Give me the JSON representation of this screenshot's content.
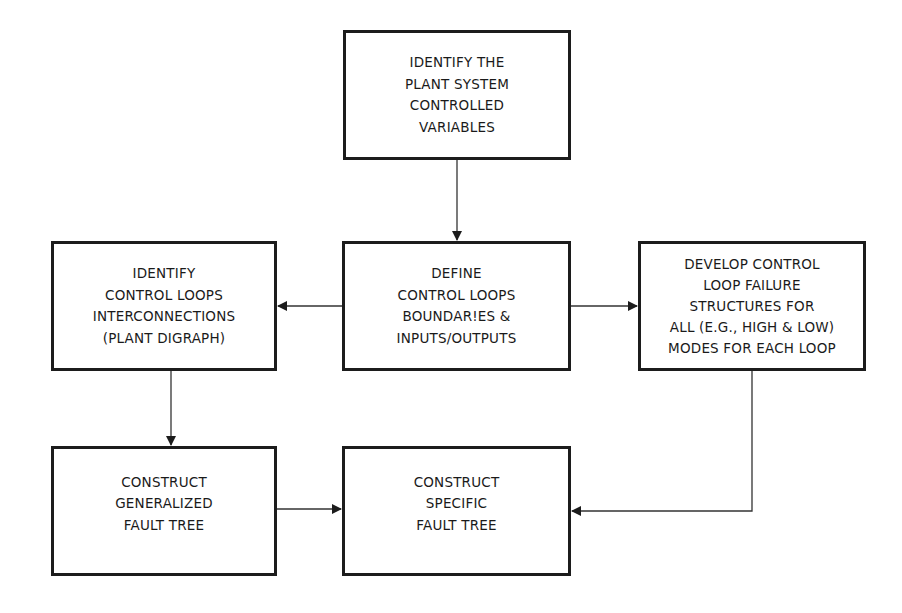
{
  "diagram": {
    "type": "flowchart",
    "nodes": [
      {
        "id": "identify-plant",
        "lines": [
          "IDENTIFY THE",
          "PLANT SYSTEM",
          "CONTROLLED",
          "VARIABLES"
        ]
      },
      {
        "id": "define-loops",
        "lines": [
          "DEFINE",
          "CONTROL LOOPS",
          "BOUNDAR!ES &",
          "INPUTS/OUTPUTS"
        ]
      },
      {
        "id": "identify-interconnections",
        "lines": [
          "IDENTIFY",
          "CONTROL LOOPS",
          "INTERCONNECTIONS",
          "(PLANT DIGRAPH)"
        ]
      },
      {
        "id": "develop-failure-structures",
        "lines": [
          "DEVELOP CONTROL",
          "LOOP FAILURE",
          "STRUCTURES FOR",
          "ALL (E.G., HIGH & LOW)",
          "MODES FOR EACH LOOP"
        ]
      },
      {
        "id": "construct-generalized",
        "lines": [
          "CONSTRUCT",
          "GENERALIZED",
          "FAULT TREE"
        ]
      },
      {
        "id": "construct-specific",
        "lines": [
          "CONSTRUCT",
          "SPECIFIC",
          "FAULT TREE"
        ]
      }
    ],
    "edges": [
      {
        "from": "identify-plant",
        "to": "define-loops"
      },
      {
        "from": "define-loops",
        "to": "identify-interconnections"
      },
      {
        "from": "define-loops",
        "to": "develop-failure-structures"
      },
      {
        "from": "identify-interconnections",
        "to": "construct-generalized"
      },
      {
        "from": "construct-generalized",
        "to": "construct-specific"
      },
      {
        "from": "develop-failure-structures",
        "to": "construct-specific"
      }
    ],
    "colors": {
      "line": "#1c1c1c",
      "background": "#ffffff"
    }
  }
}
